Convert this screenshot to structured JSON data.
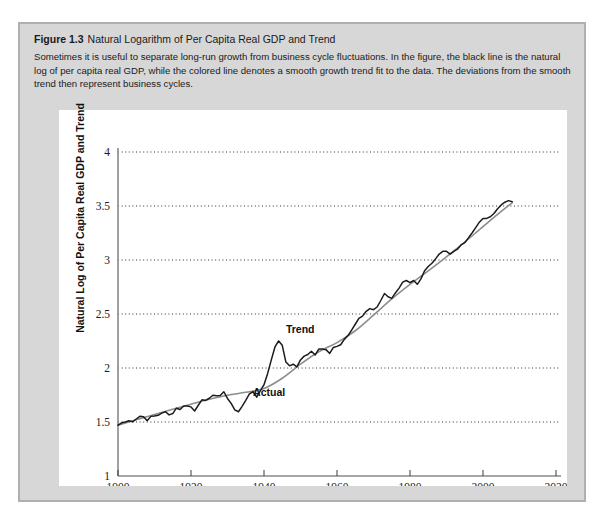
{
  "figure": {
    "number": "Figure 1.3",
    "title": "Natural Logarithm of Per Capita Real GDP and Trend",
    "caption": "Sometimes it is useful to separate long-run growth from business cycle fluctuations. In the figure, the black line is the natural log of per capita real GDP, while the colored line denotes a smooth growth trend fit to the data. The deviations from the smooth trend then represent business cycles."
  },
  "colors": {
    "panel_background": "#d7d7d7",
    "panel_border": "#b0b0b0",
    "plot_background": "#ffffff",
    "actual_line": "#1b1b1b",
    "trend_line": "#8d8d8d",
    "gridline": "#2e2e2e",
    "axis": "#8a8a8a"
  },
  "chart_data": {
    "type": "line",
    "title": "Natural Logarithm of Per Capita Real GDP and Trend",
    "xlabel": "Year",
    "ylabel": "Natural Log of Per Capita Real GDP and Trend",
    "xlim": [
      1900,
      2022
    ],
    "ylim": [
      1,
      4
    ],
    "xticks": [
      1900,
      1920,
      1940,
      1960,
      1980,
      2000,
      2020
    ],
    "yticks": [
      1,
      1.5,
      2,
      2.5,
      3,
      3.5,
      4
    ],
    "ytick_labels": [
      "1",
      "1.5",
      "2",
      "2.5",
      "3",
      "3.5",
      "4"
    ],
    "xtick_labels": [
      "1900",
      "1920",
      "1940",
      "1960",
      "1980",
      "2000",
      "2020"
    ],
    "grid": "horizontal-dotted",
    "legend": "inline-annotations",
    "annotations": [
      {
        "text": "Trend",
        "x": 1946,
        "y": 2.32
      },
      {
        "text": "Actual",
        "x": 1937,
        "y": 1.74
      }
    ],
    "series": [
      {
        "name": "Actual",
        "color": "#1b1b1b",
        "x": [
          1900,
          1901,
          1902,
          1903,
          1904,
          1905,
          1906,
          1907,
          1908,
          1909,
          1910,
          1911,
          1912,
          1913,
          1914,
          1915,
          1916,
          1917,
          1918,
          1919,
          1920,
          1921,
          1922,
          1923,
          1924,
          1925,
          1926,
          1927,
          1928,
          1929,
          1930,
          1931,
          1932,
          1933,
          1934,
          1935,
          1936,
          1937,
          1938,
          1939,
          1940,
          1941,
          1942,
          1943,
          1944,
          1945,
          1946,
          1947,
          1948,
          1949,
          1950,
          1951,
          1952,
          1953,
          1954,
          1955,
          1956,
          1957,
          1958,
          1959,
          1960,
          1961,
          1962,
          1963,
          1964,
          1965,
          1966,
          1967,
          1968,
          1969,
          1970,
          1971,
          1972,
          1973,
          1974,
          1975,
          1976,
          1977,
          1978,
          1979,
          1980,
          1981,
          1982,
          1983,
          1984,
          1985,
          1986,
          1987,
          1988,
          1989,
          1990,
          1991,
          1992,
          1993,
          1994,
          1995,
          1996,
          1997,
          1998,
          1999,
          2000,
          2001,
          2002,
          2003,
          2004,
          2005,
          2006,
          2007,
          2008
        ],
        "y": [
          1.47,
          1.493,
          1.5,
          1.512,
          1.502,
          1.528,
          1.553,
          1.548,
          1.512,
          1.552,
          1.556,
          1.562,
          1.582,
          1.595,
          1.566,
          1.578,
          1.628,
          1.616,
          1.648,
          1.648,
          1.64,
          1.602,
          1.655,
          1.705,
          1.7,
          1.72,
          1.748,
          1.742,
          1.745,
          1.78,
          1.718,
          1.672,
          1.612,
          1.595,
          1.645,
          1.7,
          1.76,
          1.78,
          1.73,
          1.79,
          1.845,
          1.95,
          2.075,
          2.195,
          2.25,
          2.21,
          2.055,
          2.02,
          2.035,
          2.01,
          2.075,
          2.11,
          2.125,
          2.155,
          2.12,
          2.175,
          2.175,
          2.17,
          2.135,
          2.19,
          2.2,
          2.215,
          2.265,
          2.3,
          2.35,
          2.405,
          2.46,
          2.48,
          2.525,
          2.55,
          2.54,
          2.565,
          2.625,
          2.69,
          2.66,
          2.645,
          2.695,
          2.74,
          2.795,
          2.81,
          2.79,
          2.81,
          2.775,
          2.825,
          2.9,
          2.94,
          2.97,
          3.01,
          3.055,
          3.08,
          3.08,
          3.055,
          3.08,
          3.1,
          3.14,
          3.16,
          3.205,
          3.25,
          3.3,
          3.35,
          3.385,
          3.385,
          3.4,
          3.43,
          3.475,
          3.51,
          3.535,
          3.55,
          3.54
        ],
        "notes": "Black jagged line; 1933 Great Depression trough near 1.60, WWII peak near 2.25 in 1944"
      },
      {
        "name": "Trend",
        "color": "#8d8d8d",
        "x": [
          1900,
          1905,
          1910,
          1915,
          1920,
          1925,
          1930,
          1935,
          1940,
          1945,
          1950,
          1955,
          1960,
          1965,
          1970,
          1975,
          1980,
          1985,
          1990,
          1995,
          2000,
          2005,
          2008
        ],
        "y": [
          1.47,
          1.52,
          1.57,
          1.618,
          1.665,
          1.71,
          1.748,
          1.775,
          1.81,
          1.905,
          2.035,
          2.15,
          2.235,
          2.345,
          2.49,
          2.64,
          2.775,
          2.9,
          3.03,
          3.165,
          3.31,
          3.45,
          3.53
        ],
        "notes": "Smooth colored growth trend fit to the data"
      }
    ]
  }
}
